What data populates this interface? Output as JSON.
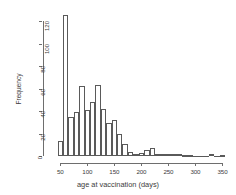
{
  "chart_data": {
    "type": "bar",
    "title": "",
    "xlabel": "age at vaccination (days)",
    "ylabel": "Frequency",
    "grid": false,
    "legend": null,
    "xlim": [
      42,
      358
    ],
    "ylim": [
      0,
      128
    ],
    "bin_width": 10,
    "xticks": [
      50,
      100,
      150,
      200,
      250,
      300,
      350
    ],
    "xtick_labels": [
      "50",
      "100",
      "150",
      "200",
      "250",
      "300",
      "350"
    ],
    "yticks": [
      0,
      20,
      40,
      60,
      80,
      100,
      120
    ],
    "ytick_labels": [
      "0",
      "20",
      "40",
      "60",
      "80",
      "100",
      "120"
    ],
    "bin_starts": [
      45,
      55,
      65,
      75,
      85,
      95,
      105,
      115,
      125,
      135,
      145,
      155,
      165,
      175,
      185,
      195,
      205,
      215,
      225,
      235,
      245,
      255,
      265,
      275,
      285,
      295,
      305,
      315,
      325,
      335,
      345
    ],
    "categories": [
      "45-55",
      "55-65",
      "65-75",
      "75-85",
      "85-95",
      "95-105",
      "105-115",
      "115-125",
      "125-135",
      "135-145",
      "145-155",
      "155-165",
      "165-175",
      "175-185",
      "185-195",
      "195-205",
      "205-215",
      "215-225",
      "225-235",
      "235-245",
      "245-255",
      "255-265",
      "265-275",
      "275-285",
      "285-295",
      "295-305",
      "305-315",
      "315-325",
      "325-335",
      "335-345",
      "345-355"
    ],
    "values": [
      13,
      125,
      35,
      39,
      62,
      41,
      48,
      63,
      42,
      29,
      32,
      20,
      11,
      4,
      2,
      3,
      5,
      7,
      2,
      2,
      2,
      2,
      2,
      1,
      1,
      0,
      0,
      0,
      2,
      0,
      1
    ]
  },
  "axis": {
    "y_title": "Frequency",
    "x_title": "age at vaccination (days)"
  }
}
